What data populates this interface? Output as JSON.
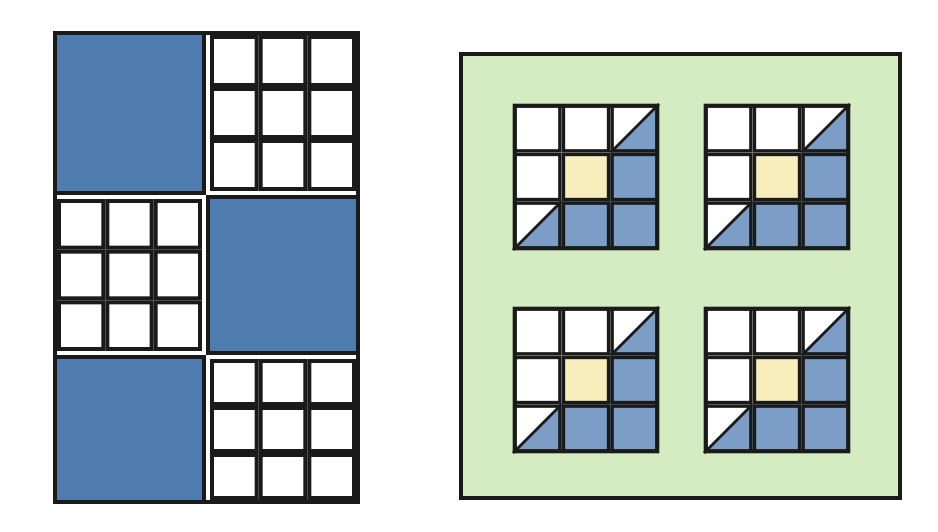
{
  "canvas": {
    "width": 938,
    "height": 532,
    "background_color": "#FFFFFF",
    "description": "Two geometric tiling figures side by side on a plain white background"
  },
  "palette": {
    "blue_solid": "#4E7CAE",
    "blue_light": "#7C9DC6",
    "white": "#FFFFFF",
    "yellow": "#F7EDBD",
    "green_panel": "#D5EBC1",
    "outline": "#1A1A1A"
  },
  "figures": [
    {
      "id": "left-figure",
      "name": "checkerboard-block-figure",
      "label": "Left figure",
      "x": 53,
      "y": 31,
      "width": 307,
      "height": 473,
      "columns": 2,
      "rows": 3,
      "column_split_x": 206,
      "row_split_y": [
        195,
        355
      ],
      "background_color": "#FFFFFF",
      "border_color": "#1A1A1A",
      "border_width": 4,
      "cells": [
        {
          "row": 0,
          "col": 0,
          "type": "solid",
          "fill": "#4E7CAE",
          "name": "block-solid-blue"
        },
        {
          "row": 0,
          "col": 1,
          "type": "grid3x3",
          "fill": "#FFFFFF",
          "name": "block-white-grid"
        },
        {
          "row": 1,
          "col": 0,
          "type": "grid3x3",
          "fill": "#FFFFFF",
          "name": "block-white-grid"
        },
        {
          "row": 1,
          "col": 1,
          "type": "solid",
          "fill": "#4E7CAE",
          "name": "block-solid-blue"
        },
        {
          "row": 2,
          "col": 0,
          "type": "solid",
          "fill": "#4E7CAE",
          "name": "block-solid-blue"
        },
        {
          "row": 2,
          "col": 1,
          "type": "grid3x3",
          "fill": "#FFFFFF",
          "name": "block-white-grid"
        }
      ]
    },
    {
      "id": "right-figure",
      "name": "green-panel-tile-figure",
      "label": "Right figure",
      "x": 459,
      "y": 52,
      "width": 443,
      "height": 448,
      "panel_fill": "#D5EBC1",
      "border_color": "#1A1A1A",
      "border_width": 4,
      "tile_count": 4,
      "tile_size": 146,
      "tile_positions": [
        {
          "index": 0,
          "x": 513,
          "y": 104,
          "name": "tile-top-left"
        },
        {
          "index": 1,
          "x": 704,
          "y": 104,
          "name": "tile-top-right"
        },
        {
          "index": 2,
          "x": 513,
          "y": 307,
          "name": "tile-bottom-left"
        },
        {
          "index": 3,
          "x": 704,
          "y": 307,
          "name": "tile-bottom-right"
        }
      ],
      "tile_pattern": {
        "rows": 3,
        "cols": 3,
        "cells": [
          {
            "row": 0,
            "col": 0,
            "type": "full",
            "fill": "#FFFFFF"
          },
          {
            "row": 0,
            "col": 1,
            "type": "full",
            "fill": "#FFFFFF"
          },
          {
            "row": 0,
            "col": 2,
            "type": "diagonal",
            "fill_upper_left": "#FFFFFF",
            "fill_lower_right": "#7C9DC6"
          },
          {
            "row": 1,
            "col": 0,
            "type": "full",
            "fill": "#FFFFFF"
          },
          {
            "row": 1,
            "col": 1,
            "type": "full",
            "fill": "#F7EDBD"
          },
          {
            "row": 1,
            "col": 2,
            "type": "full",
            "fill": "#7C9DC6"
          },
          {
            "row": 2,
            "col": 0,
            "type": "diagonal",
            "fill_upper_left": "#FFFFFF",
            "fill_lower_right": "#7C9DC6"
          },
          {
            "row": 2,
            "col": 1,
            "type": "full",
            "fill": "#7C9DC6"
          },
          {
            "row": 2,
            "col": 2,
            "type": "full",
            "fill": "#7C9DC6"
          }
        ]
      }
    }
  ]
}
